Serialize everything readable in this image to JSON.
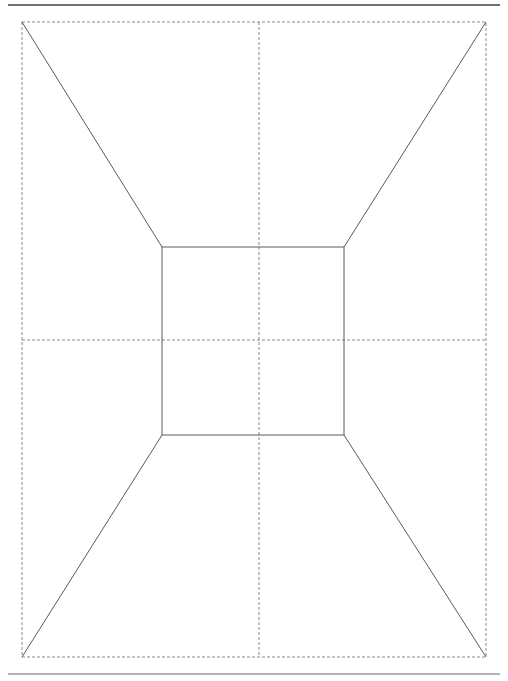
{
  "figure": {
    "canvas": {
      "width": 508,
      "height": 681,
      "background": "#ffffff"
    },
    "colors": {
      "solid_line": "#5a5a5a",
      "dashed_line": "#8a8a8a",
      "top_rule": "#3f3f3f",
      "bottom_rule": "#9a9a9a"
    },
    "strokes": {
      "solid_width": 1,
      "dashed_width": 1,
      "dash_pattern": "3,2",
      "top_rule_width": 1.4,
      "bottom_rule_width": 1.6
    },
    "rules": {
      "top": {
        "label": "top-horizontal-rule",
        "x1": 8,
        "y1": 5,
        "x2": 500,
        "y2": 5
      },
      "bottom": {
        "label": "bottom-horizontal-rule",
        "x1": 8,
        "y1": 674,
        "x2": 500,
        "y2": 674
      }
    },
    "outer_frame": {
      "label": "outer-dashed-frame",
      "x": 22,
      "y": 22,
      "width": 464,
      "height": 635,
      "corners": {
        "top_left": [
          22,
          22
        ],
        "top_right": [
          486,
          22
        ],
        "bottom_right": [
          486,
          657
        ],
        "bottom_left": [
          22,
          657
        ]
      }
    },
    "inner_square": {
      "label": "inner-solid-square",
      "x": 162,
      "y": 247,
      "width": 182,
      "height": 188,
      "corners": {
        "top_left": [
          162,
          247
        ],
        "top_right": [
          344,
          247
        ],
        "bottom_right": [
          344,
          435
        ],
        "bottom_left": [
          162,
          435
        ]
      }
    },
    "center_lines": {
      "vertical": {
        "label": "vertical-center-dashed-line",
        "x1": 259,
        "y1": 22,
        "x2": 259,
        "y2": 657
      },
      "horizontal": {
        "label": "horizontal-center-dashed-line",
        "x1": 22,
        "y1": 340,
        "x2": 486,
        "y2": 340
      },
      "vanishing_point": [
        259,
        340
      ]
    },
    "orthogonals": [
      {
        "label": "orthogonal-top-left",
        "x1": 22,
        "y1": 22,
        "x2": 162,
        "y2": 247
      },
      {
        "label": "orthogonal-top-right",
        "x1": 486,
        "y1": 22,
        "x2": 344,
        "y2": 247
      },
      {
        "label": "orthogonal-bottom-right",
        "x1": 486,
        "y1": 657,
        "x2": 344,
        "y2": 435
      },
      {
        "label": "orthogonal-bottom-left",
        "x1": 22,
        "y1": 657,
        "x2": 162,
        "y2": 435
      }
    ]
  }
}
